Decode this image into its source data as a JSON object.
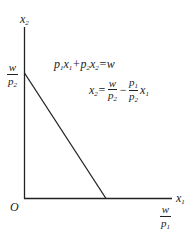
{
  "diagram": {
    "axes": {
      "y_label": {
        "var": "x",
        "sub": "2"
      },
      "x_label": {
        "var": "x",
        "sub": "1"
      },
      "origin_label": "O"
    },
    "intercepts": {
      "y": {
        "num": "w",
        "den_var": "p",
        "den_sub": "2"
      },
      "x": {
        "num": "w",
        "den_var": "p",
        "den_sub": "1"
      }
    },
    "equations": {
      "budget": "p₁x₁+p₂x₂=w",
      "slope_form": "x₂=w/p₂ − (p₁/p₂)x₁"
    },
    "line_color": "#222222"
  }
}
